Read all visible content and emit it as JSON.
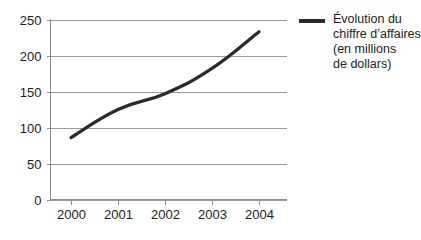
{
  "chart_data": {
    "type": "line",
    "title": "",
    "xlabel": "",
    "ylabel": "",
    "categories": [
      "2000",
      "2001",
      "2002",
      "2003",
      "2004"
    ],
    "x": [
      2000,
      2001,
      2002,
      2003,
      2004
    ],
    "values": [
      86,
      125,
      147,
      182,
      233
    ],
    "series": [
      {
        "name": "Évolution du chiffre d'affaires (en millions de dollars)",
        "values": [
          86,
          125,
          147,
          182,
          233
        ],
        "color": "#2b2b2b"
      }
    ],
    "ylim": [
      0,
      250
    ],
    "yticks": [
      0,
      50,
      100,
      150,
      200,
      250
    ],
    "ytick_labels": [
      "0",
      "50",
      "100",
      "150",
      "200",
      "250"
    ],
    "xtick_labels": [
      "2000",
      "2001",
      "2002",
      "2003",
      "2004"
    ],
    "grid": true,
    "grid_axis": "y",
    "legend_position": "right"
  },
  "legend": {
    "swatch_color": "#2b2b2b",
    "lines": [
      "Évolution du",
      "chiffre d’affaires",
      "(en millions",
      "de dollars)"
    ]
  },
  "colors": {
    "series_line": "#2b2b2b",
    "gridline": "#9a9a9a",
    "axis": "#8d8d8d",
    "background": "#ffffff",
    "text": "#1c1c1c"
  }
}
